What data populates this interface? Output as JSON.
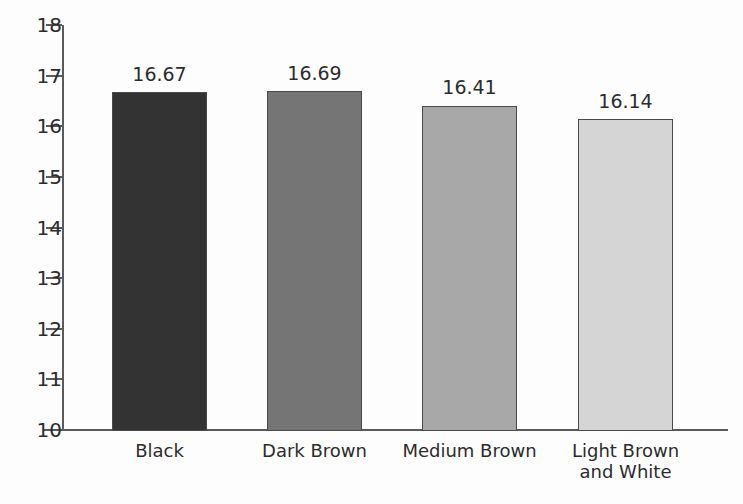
{
  "chart_data": {
    "type": "bar",
    "title": "",
    "subtitle": "",
    "xlabel": "",
    "ylabel": "",
    "categories": [
      "Black",
      "Dark Brown",
      "Medium Brown",
      "Light Brown\nand White"
    ],
    "values": [
      16.67,
      16.69,
      16.41,
      16.14
    ],
    "value_labels": [
      "16.67",
      "16.69",
      "16.41",
      "16.14"
    ],
    "ylim": [
      10,
      18
    ],
    "yticks": [
      10,
      11,
      12,
      13,
      14,
      15,
      16,
      17,
      18
    ],
    "ytick_labels": [
      "10",
      "11",
      "12",
      "13",
      "14",
      "15",
      "16",
      "17",
      "18"
    ],
    "grid": false,
    "legend": "none",
    "bar_colors": [
      "#333333",
      "#757575",
      "#a8a8a8",
      "#d5d5d5"
    ],
    "bar_border_color": "#4a4a4a",
    "axis_color": "#5a5a5a",
    "text_color": "#2c2c2c",
    "background": "#fdfdfd"
  }
}
